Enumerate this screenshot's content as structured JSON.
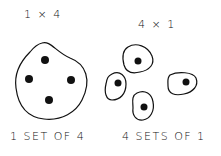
{
  "left": {
    "title": "1 × 4",
    "caption": "1 SET OF 4",
    "sets": 1,
    "items_per_set": 4
  },
  "right": {
    "title": "4 × 1",
    "caption": "4 SETS OF 1",
    "sets": 4,
    "items_per_set": 1
  },
  "colors": {
    "ink": "#111111",
    "background": "#ffffff"
  }
}
